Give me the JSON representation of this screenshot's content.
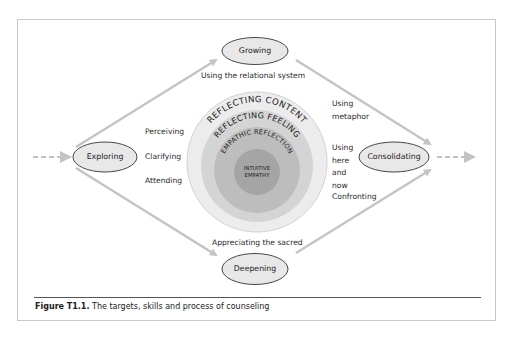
{
  "figure": {
    "caption_label": "Figure T1.1.",
    "caption_text": " The targets, skills and process of counseling"
  },
  "nodes": {
    "exploring": "Exploring",
    "growing": "Growing",
    "consolidating": "Consolidating",
    "deepening": "Deepening"
  },
  "rings": {
    "outer": "REFLECTING CONTENT",
    "second": "REFLECTING FEELING",
    "third": "EMPATHIC REFLECTION",
    "core_line1": "INTUITIVE",
    "core_line2": "EMPATHY"
  },
  "skills_left": [
    "Perceiving",
    "Clarifying",
    "Attending"
  ],
  "skills_right": {
    "metaphor": "Using metaphor",
    "here_now": "Using here and now",
    "confronting": "Confronting"
  },
  "edge_labels": {
    "top": "Using the relational system",
    "bottom": "Appreciating the sacred"
  },
  "colors": {
    "ring_outer": "#ececec",
    "ring_second": "#d4d4d4",
    "ring_third": "#bdbdbd",
    "ring_core": "#a5a5a5",
    "ellipse_fill": "#e8e8e8",
    "arrow": "#c4c4c4"
  }
}
